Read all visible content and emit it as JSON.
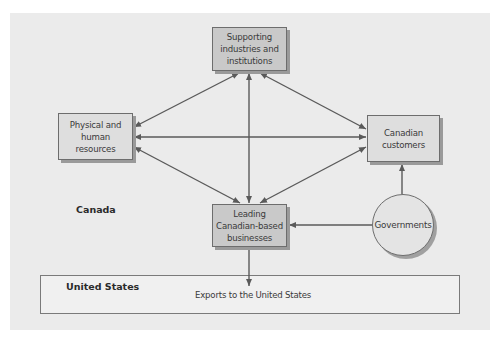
{
  "diagram": {
    "regions": {
      "canada_label": "Canada",
      "us_label": "United States"
    },
    "nodes": {
      "supporting": "Supporting\nindustries and\ninstitutions",
      "physical": "Physical and\nhuman\nresources",
      "customers": "Canadian\ncustomers",
      "businesses": "Leading\nCanadian-based\nbusinesses",
      "governments": "Governments"
    },
    "exports_label": "Exports to the United States",
    "edges": [
      {
        "from": "supporting",
        "to": "physical",
        "type": "bidirectional"
      },
      {
        "from": "supporting",
        "to": "customers",
        "type": "bidirectional"
      },
      {
        "from": "supporting",
        "to": "businesses",
        "type": "bidirectional"
      },
      {
        "from": "physical",
        "to": "customers",
        "type": "bidirectional"
      },
      {
        "from": "physical",
        "to": "businesses",
        "type": "bidirectional"
      },
      {
        "from": "customers",
        "to": "businesses",
        "type": "bidirectional"
      },
      {
        "from": "governments",
        "to": "customers",
        "type": "directed"
      },
      {
        "from": "governments",
        "to": "businesses",
        "type": "directed"
      },
      {
        "from": "businesses",
        "to": "exports",
        "type": "directed"
      }
    ],
    "colors": {
      "panel": "#ebebeb",
      "box_fill": "#c9c9c9",
      "light_box_fill": "#dedede",
      "circle_fill": "#e4e4e4",
      "line": "#5a5a5a"
    }
  }
}
